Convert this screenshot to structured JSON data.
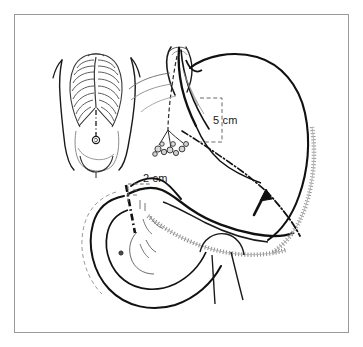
{
  "figure": {
    "caption": "",
    "background_color": "#ffffff",
    "frame": {
      "name": "figure-border",
      "color": "#9a9a9a",
      "x": 14,
      "y": 14,
      "width": 335,
      "height": 319,
      "stroke_width": 1
    },
    "ink_color": "#111111",
    "light_ink_color": "#8d8d8d",
    "mid_ink_color": "#5a5a5a"
  },
  "annotations": {
    "measurement_5cm": {
      "label": "5 cm",
      "x": 213,
      "y": 121,
      "bracket": {
        "x": 200,
        "y": 98,
        "width": 22,
        "height": 44,
        "style": "dashed"
      }
    },
    "measurement_2cm": {
      "label": "2 cm",
      "x": 143,
      "y": 182,
      "bracket": {
        "x": 128,
        "y": 184,
        "width": 24,
        "height": 18,
        "style": "dashed"
      }
    }
  },
  "parts": {
    "torso_inset": {
      "name": "Anterior torso with rib cage",
      "rib_pairs": 8,
      "midline_style": "dash-dot",
      "umbilicus": true
    },
    "esophagus": {
      "name": "Distal esophagus",
      "vagus_branches": 4,
      "nodule_cluster_count": 9
    },
    "stomach": {
      "name": "Stomach",
      "regions": [
        "fundus",
        "body",
        "antrum",
        "pylorus"
      ],
      "greater_curvature_hatching": true,
      "lesser_curvature_hatching": true
    },
    "duodenum": {
      "name": "Duodenal C-loop",
      "transection_line_style": "dash-dot"
    },
    "resection_line": {
      "name": "Planned resection line",
      "style": "dash-dot"
    },
    "arrow": {
      "name": "Direction arrow",
      "direction": "up-left",
      "tip_x": 264,
      "tip_y": 190
    }
  }
}
